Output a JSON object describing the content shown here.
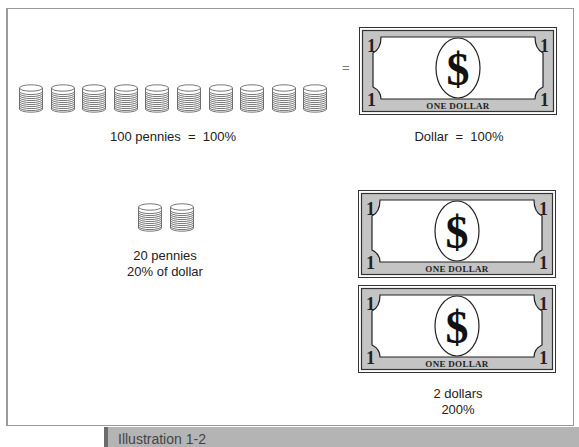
{
  "illustration": {
    "caption": "Illustration 1-2",
    "equals_sign": "=",
    "rows": [
      {
        "coins": {
          "stack_count": 10,
          "label": "100 pennies  =  100%"
        },
        "bills": {
          "count": 1,
          "label": "Dollar  =  100%"
        }
      },
      {
        "coins": {
          "stack_count": 2,
          "label_line1": "20 pennies",
          "label_line2": "20% of dollar"
        },
        "bills": {
          "count": 2,
          "label_line1": "2 dollars",
          "label_line2": "200%"
        }
      }
    ],
    "bill": {
      "denomination": "1",
      "symbol": "$",
      "text": "ONE DOLLAR"
    },
    "colors": {
      "bill_fill": "#c4c4c4",
      "bill_border": "#333333",
      "coin_stroke": "#555555",
      "caption_bar": "#b4b4b4",
      "caption_stripe": "#6b6b6b"
    }
  }
}
